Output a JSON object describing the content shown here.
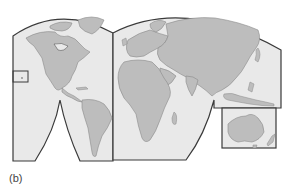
{
  "figure": {
    "label": "(b)",
    "type": "interrupted world map projection (lobed)",
    "colors": {
      "ocean": "#e9e9e9",
      "land": "#bdbdbd",
      "coast": "#8a8a8a",
      "frame": "#3a3a3a",
      "background": "#ffffff"
    },
    "lobes": [
      {
        "name": "americas-lobe",
        "region": "North and South America"
      },
      {
        "name": "eurasia-africa-lobe",
        "region": "Europe, Asia, Africa"
      },
      {
        "name": "oceania-inset",
        "region": "Australia and New Zealand"
      }
    ],
    "insets": [
      {
        "name": "hawaii-inset",
        "region": "Hawaii"
      }
    ]
  }
}
